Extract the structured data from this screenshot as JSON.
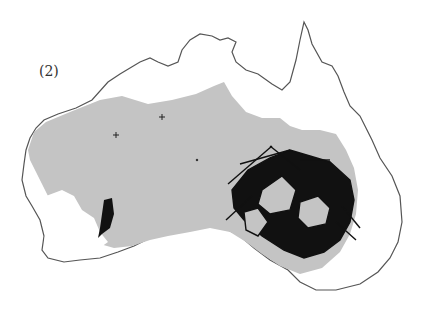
{
  "figure": {
    "panel_label": "(2)",
    "colors": {
      "background": "#ffffff",
      "coastline": "#555555",
      "range_fill": "#c4c4c4",
      "network": "#111111",
      "markers": "#222222"
    },
    "layers": [
      {
        "name": "coastline",
        "description": "Outline of Australian mainland"
      },
      {
        "name": "distribution-area",
        "description": "Gray shaded inland region"
      },
      {
        "name": "network-southeast",
        "description": "Dense black network of connected polygons in south-eastern Australia"
      },
      {
        "name": "network-southwest",
        "description": "Small black network blob in south-western Australia"
      },
      {
        "name": "point-markers",
        "description": "Small cross markers in western interior"
      }
    ]
  }
}
